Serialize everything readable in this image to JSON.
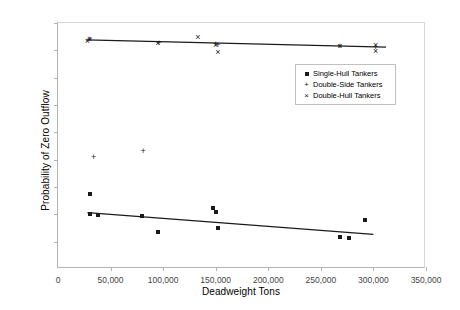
{
  "chart_data": {
    "type": "scatter",
    "title": "",
    "xlabel": "Deadweight Tons",
    "ylabel": "Probability of Zero Outflow",
    "xlim": [
      0,
      350000
    ],
    "ylim": [
      0,
      0.9
    ],
    "grid": false,
    "legend_position": "upper-right-inside",
    "xticks": [
      0,
      50000,
      100000,
      150000,
      200000,
      250000,
      300000,
      350000
    ],
    "xtick_labels": [
      "0",
      "50,000",
      "100,000",
      "150,000",
      "200,000",
      "250,000",
      "300,000",
      "350,000"
    ],
    "yticks": [
      0,
      0.1,
      0.2,
      0.3,
      0.4,
      0.5,
      0.6,
      0.7,
      0.8,
      0.9
    ],
    "ytick_labels": [
      "0",
      "0.1",
      "0.2",
      "0.3",
      "0.4",
      "0.5",
      "0.6",
      "0.7",
      "0.8",
      "0.9"
    ],
    "series": [
      {
        "name": "Single-Hull Tankers",
        "marker": "square",
        "color": "#1a1a1a",
        "points": [
          [
            30000,
            0.275
          ],
          [
            30000,
            0.2
          ],
          [
            38000,
            0.198
          ],
          [
            80000,
            0.193
          ],
          [
            95000,
            0.135
          ],
          [
            147000,
            0.222
          ],
          [
            150000,
            0.21
          ],
          [
            152000,
            0.15
          ],
          [
            268000,
            0.118
          ],
          [
            277000,
            0.115
          ],
          [
            292000,
            0.178
          ]
        ],
        "trendline": {
          "x0": 28000,
          "y0": 0.206,
          "x1": 300000,
          "y1": 0.127
        }
      },
      {
        "name": "Double-Side Tankers",
        "marker": "plus",
        "color": "#1a1a1a",
        "points": [
          [
            34000,
            0.41
          ],
          [
            81000,
            0.43
          ],
          [
            30000,
            0.84
          ],
          [
            96000,
            0.826
          ],
          [
            150000,
            0.822
          ],
          [
            152000,
            0.82
          ],
          [
            268000,
            0.815
          ],
          [
            302000,
            0.812
          ]
        ]
      },
      {
        "name": "Double-Hull Tankers",
        "marker": "x",
        "color": "#1a1a1a",
        "points": [
          [
            28000,
            0.833
          ],
          [
            30000,
            0.84
          ],
          [
            95000,
            0.826
          ],
          [
            150000,
            0.818
          ],
          [
            152000,
            0.793
          ],
          [
            133000,
            0.848
          ],
          [
            268000,
            0.815
          ],
          [
            302000,
            0.82
          ],
          [
            302000,
            0.798
          ]
        ],
        "trendline": {
          "x0": 27000,
          "y0": 0.838,
          "x1": 312000,
          "y1": 0.812
        }
      }
    ]
  },
  "legend": {
    "items": [
      {
        "key": "square",
        "label": "Single-Hull Tankers"
      },
      {
        "key": "plus",
        "label": "Double-Side Tankers"
      },
      {
        "key": "x",
        "label": "Double-Hull Tankers"
      }
    ]
  }
}
